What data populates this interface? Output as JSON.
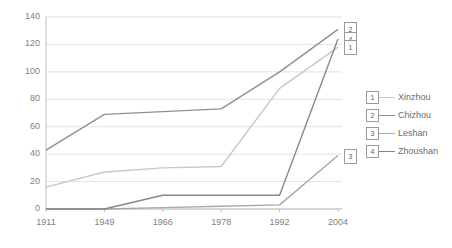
{
  "chart_data": {
    "type": "line",
    "title": "",
    "xlabel": "",
    "ylabel": "",
    "categories": [
      "1911",
      "1949",
      "1966",
      "1978",
      "1992",
      "2004"
    ],
    "ylim": [
      0,
      140
    ],
    "yticks": [
      "0",
      "20",
      "40",
      "60",
      "80",
      "100",
      "120",
      "140"
    ],
    "grid": true,
    "legend_position": "right",
    "series": [
      {
        "name": "Xinzhou",
        "key": "1",
        "color": "#c8c8c8",
        "values": [
          16,
          27,
          30,
          31,
          88,
          118
        ]
      },
      {
        "name": "Chizhou",
        "key": "2",
        "color": "#909090",
        "values": [
          43,
          69,
          71,
          73,
          100,
          131
        ]
      },
      {
        "name": "Leshan",
        "key": "3",
        "color": "#a8a8a8",
        "values": [
          0,
          0,
          1,
          2,
          3,
          39
        ]
      },
      {
        "name": "Zhoushan",
        "key": "4",
        "color": "#888888",
        "values": [
          0,
          0,
          10,
          10,
          10,
          124
        ]
      }
    ],
    "end_markers": [
      {
        "key": "2",
        "series": "Chizhou",
        "value": 131
      },
      {
        "key": "4",
        "series": "Zhoushan",
        "value": 124
      },
      {
        "key": "1",
        "series": "Xinzhou",
        "value": 118
      },
      {
        "key": "3",
        "series": "Leshan",
        "value": 39
      }
    ],
    "colors": {
      "gridline": "#e2e2e2",
      "axis": "#bdbdbd",
      "tick_text": "#808080",
      "legend_text": "#6b6b6b"
    }
  }
}
